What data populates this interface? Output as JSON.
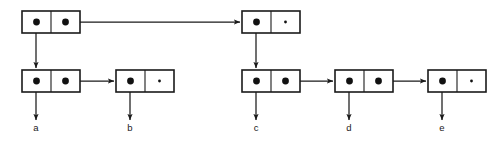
{
  "diagram": {
    "type": "box-and-pointer",
    "width": 494,
    "height": 147,
    "background_color": "#ffffff",
    "stroke_color": "#1a1a1a",
    "dot_color": "#111111",
    "box": {
      "width": 58,
      "height": 22,
      "stroke_width": 1.6
    },
    "rows": {
      "top_y": 11,
      "bottom_y": 70
    },
    "cells": [
      {
        "id": "root",
        "name": "cons-cell-root",
        "row": "top",
        "x": 22,
        "y": 11,
        "car": "pointer",
        "cdr": "pointer",
        "label": ""
      },
      {
        "id": "c-head",
        "name": "cons-cell-c-head",
        "row": "top",
        "x": 242,
        "y": 11,
        "car": "pointer",
        "cdr": "nil",
        "label": ""
      },
      {
        "id": "a",
        "name": "cons-cell-a",
        "row": "bottom",
        "x": 22,
        "y": 70,
        "car": "pointer",
        "cdr": "pointer",
        "label": "a"
      },
      {
        "id": "b",
        "name": "cons-cell-b",
        "row": "bottom",
        "x": 116,
        "y": 70,
        "car": "pointer",
        "cdr": "nil",
        "label": "b"
      },
      {
        "id": "c",
        "name": "cons-cell-c",
        "row": "bottom",
        "x": 242,
        "y": 70,
        "car": "pointer",
        "cdr": "pointer",
        "label": "c"
      },
      {
        "id": "d",
        "name": "cons-cell-d",
        "row": "bottom",
        "x": 335,
        "y": 70,
        "car": "pointer",
        "cdr": "pointer",
        "label": "d"
      },
      {
        "id": "e",
        "name": "cons-cell-e",
        "row": "bottom",
        "x": 428,
        "y": 70,
        "car": "pointer",
        "cdr": "nil",
        "label": "e"
      }
    ],
    "leaf_labels": [
      {
        "text": "a",
        "x": 36,
        "y": 131
      },
      {
        "text": "b",
        "x": 130,
        "y": 131
      },
      {
        "text": "c",
        "x": 256,
        "y": 131
      },
      {
        "text": "d",
        "x": 349,
        "y": 131
      },
      {
        "text": "e",
        "x": 442,
        "y": 131
      }
    ],
    "arrows": [
      {
        "id": "root-cdr-to-c-head",
        "name": "arrow-root-cdr-to-c-head",
        "orientation": "horizontal",
        "x1": 65,
        "y1": 22,
        "x2": 240,
        "y2": 22
      },
      {
        "id": "root-car-to-a",
        "name": "arrow-root-car-to-cell-a",
        "orientation": "vertical",
        "x1": 36,
        "y1": 22,
        "x2": 36,
        "y2": 68
      },
      {
        "id": "a-cdr-to-b",
        "name": "arrow-a-cdr-to-cell-b",
        "orientation": "horizontal",
        "x1": 65,
        "y1": 81,
        "x2": 114,
        "y2": 81
      },
      {
        "id": "a-car-to-leaf",
        "name": "arrow-a-car-to-leaf-a",
        "orientation": "vertical",
        "x1": 36,
        "y1": 81,
        "x2": 36,
        "y2": 120
      },
      {
        "id": "b-car-to-leaf",
        "name": "arrow-b-car-to-leaf-b",
        "orientation": "vertical",
        "x1": 130,
        "y1": 81,
        "x2": 130,
        "y2": 120
      },
      {
        "id": "chead-car-to-c",
        "name": "arrow-c-head-car-to-cell-c",
        "orientation": "vertical",
        "x1": 256,
        "y1": 22,
        "x2": 256,
        "y2": 68
      },
      {
        "id": "c-car-to-leaf",
        "name": "arrow-c-car-to-leaf-c",
        "orientation": "vertical",
        "x1": 256,
        "y1": 81,
        "x2": 256,
        "y2": 120
      },
      {
        "id": "c-cdr-to-d",
        "name": "arrow-c-cdr-to-cell-d",
        "orientation": "horizontal",
        "x1": 285,
        "y1": 81,
        "x2": 333,
        "y2": 81
      },
      {
        "id": "d-car-to-leaf",
        "name": "arrow-d-car-to-leaf-d",
        "orientation": "vertical",
        "x1": 349,
        "y1": 81,
        "x2": 349,
        "y2": 120
      },
      {
        "id": "d-cdr-to-e",
        "name": "arrow-d-cdr-to-cell-e",
        "orientation": "horizontal",
        "x1": 378,
        "y1": 81,
        "x2": 426,
        "y2": 81
      },
      {
        "id": "e-car-to-leaf",
        "name": "arrow-e-car-to-leaf-e",
        "orientation": "vertical",
        "x1": 442,
        "y1": 81,
        "x2": 442,
        "y2": 120
      }
    ]
  }
}
